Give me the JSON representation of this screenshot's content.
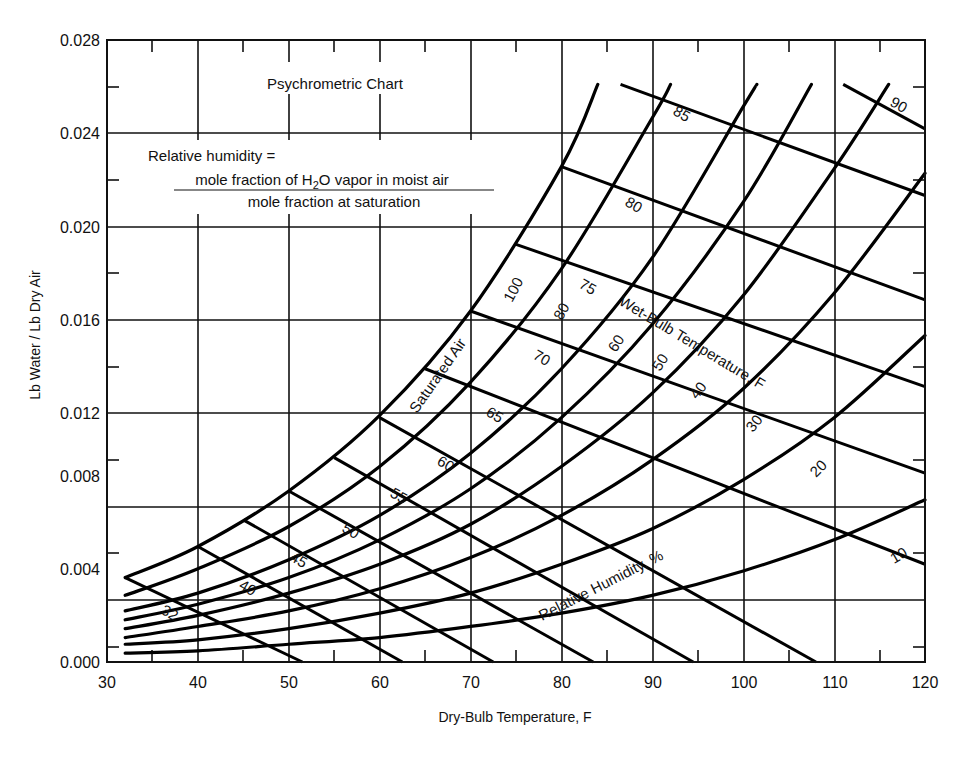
{
  "chart_data": {
    "type": "line",
    "title": "Psychrometric Chart",
    "xlabel": "Dry-Bulb Temperature, F",
    "ylabel": "Lb Water / Lb Dry Air",
    "xlim": [
      30,
      120
    ],
    "ylim": [
      0.0,
      0.028
    ],
    "x_ticks": [
      30,
      40,
      50,
      60,
      70,
      80,
      90,
      100,
      110,
      120
    ],
    "x_tick_labels": [
      "30",
      "40",
      "50",
      "60",
      "70",
      "80",
      "90",
      "100",
      "110",
      "120"
    ],
    "y_ticks": [
      0.0,
      0.004,
      0.008,
      0.012,
      0.016,
      0.02,
      0.024,
      0.028
    ],
    "y_tick_labels": [
      "0.000",
      "0.004",
      "0.008",
      "0.012",
      "0.016",
      "0.020",
      "0.024",
      "0.028"
    ],
    "grid": true,
    "annotation_definition": {
      "line1": "Relative humidity =",
      "numerator": "mole fraction of H2O vapor in moist air",
      "denominator": "mole fraction at saturation"
    },
    "labels": {
      "saturated": "Saturated Air",
      "wet_bulb_family": "Wet-Bulb Temperature, F",
      "rh_family": "Relative Humidity, %"
    },
    "relative_humidity_series": [
      {
        "name": "100",
        "points": [
          [
            32,
            0.0038
          ],
          [
            40,
            0.0052
          ],
          [
            50,
            0.0077
          ],
          [
            60,
            0.0111
          ],
          [
            70,
            0.0158
          ],
          [
            80,
            0.0223
          ],
          [
            84,
            0.026
          ]
        ]
      },
      {
        "name": "80",
        "points": [
          [
            32,
            0.003
          ],
          [
            40,
            0.0042
          ],
          [
            50,
            0.0061
          ],
          [
            60,
            0.0088
          ],
          [
            70,
            0.0126
          ],
          [
            80,
            0.0177
          ],
          [
            90,
            0.0245
          ],
          [
            92,
            0.026
          ]
        ]
      },
      {
        "name": "60",
        "points": [
          [
            32,
            0.0023
          ],
          [
            40,
            0.0031
          ],
          [
            50,
            0.0046
          ],
          [
            60,
            0.0066
          ],
          [
            70,
            0.0094
          ],
          [
            80,
            0.0132
          ],
          [
            90,
            0.0182
          ],
          [
            100,
            0.025
          ],
          [
            101.5,
            0.026
          ]
        ]
      },
      {
        "name": "50",
        "points": [
          [
            32,
            0.0019
          ],
          [
            40,
            0.0026
          ],
          [
            50,
            0.0038
          ],
          [
            60,
            0.0055
          ],
          [
            70,
            0.0078
          ],
          [
            80,
            0.011
          ],
          [
            90,
            0.0152
          ],
          [
            100,
            0.0207
          ],
          [
            107.5,
            0.026
          ]
        ]
      },
      {
        "name": "40",
        "points": [
          [
            32,
            0.0015
          ],
          [
            40,
            0.0021
          ],
          [
            50,
            0.0031
          ],
          [
            60,
            0.0044
          ],
          [
            70,
            0.0062
          ],
          [
            80,
            0.0088
          ],
          [
            90,
            0.0121
          ],
          [
            100,
            0.0165
          ],
          [
            110,
            0.0222
          ],
          [
            116,
            0.026
          ]
        ]
      },
      {
        "name": "30",
        "points": [
          [
            32,
            0.0011
          ],
          [
            40,
            0.0016
          ],
          [
            50,
            0.0023
          ],
          [
            60,
            0.0033
          ],
          [
            70,
            0.0047
          ],
          [
            80,
            0.0066
          ],
          [
            90,
            0.0091
          ],
          [
            100,
            0.0123
          ],
          [
            110,
            0.0166
          ],
          [
            120,
            0.022
          ]
        ]
      },
      {
        "name": "20",
        "points": [
          [
            32,
            0.0008
          ],
          [
            40,
            0.001
          ],
          [
            50,
            0.0015
          ],
          [
            60,
            0.0022
          ],
          [
            70,
            0.0031
          ],
          [
            80,
            0.0044
          ],
          [
            90,
            0.006
          ],
          [
            100,
            0.0082
          ],
          [
            110,
            0.011
          ],
          [
            120,
            0.0147
          ]
        ]
      },
      {
        "name": "10",
        "points": [
          [
            32,
            0.0004
          ],
          [
            40,
            0.0005
          ],
          [
            50,
            0.0008
          ],
          [
            60,
            0.0011
          ],
          [
            70,
            0.0016
          ],
          [
            80,
            0.0022
          ],
          [
            90,
            0.003
          ],
          [
            100,
            0.0041
          ],
          [
            110,
            0.0055
          ],
          [
            120,
            0.0073
          ]
        ]
      }
    ],
    "wet_bulb_series": [
      {
        "name": "32",
        "points": [
          [
            32,
            0.0038
          ],
          [
            51.5,
            0.0
          ]
        ]
      },
      {
        "name": "40",
        "points": [
          [
            40,
            0.0052
          ],
          [
            62.5,
            0.0
          ]
        ]
      },
      {
        "name": "45",
        "points": [
          [
            45,
            0.0064
          ],
          [
            72.5,
            0.0
          ]
        ]
      },
      {
        "name": "50",
        "points": [
          [
            50,
            0.0077
          ],
          [
            83.5,
            0.0
          ]
        ]
      },
      {
        "name": "55",
        "points": [
          [
            55,
            0.0092
          ],
          [
            94.5,
            0.0
          ]
        ]
      },
      {
        "name": "60",
        "points": [
          [
            60,
            0.011
          ],
          [
            108,
            0.0
          ]
        ]
      },
      {
        "name": "65",
        "points": [
          [
            65,
            0.0132
          ],
          [
            120,
            0.0044
          ]
        ]
      },
      {
        "name": "70",
        "points": [
          [
            70,
            0.0158
          ],
          [
            120,
            0.0085
          ]
        ]
      },
      {
        "name": "75",
        "points": [
          [
            75,
            0.0188
          ],
          [
            120,
            0.0124
          ]
        ]
      },
      {
        "name": "80",
        "points": [
          [
            80,
            0.0223
          ],
          [
            120,
            0.0163
          ]
        ]
      },
      {
        "name": "85",
        "points": [
          [
            86.5,
            0.026
          ],
          [
            120,
            0.021
          ]
        ]
      },
      {
        "name": "90",
        "points": [
          [
            111,
            0.026
          ],
          [
            120,
            0.024
          ]
        ]
      }
    ]
  },
  "text": {
    "title": "Psychrometric Chart",
    "def_line1": "Relative humidity =",
    "def_num": "mole fraction of H",
    "def_num_sub": "2",
    "def_num_rest": "O vapor in moist air",
    "def_den": "mole fraction at saturation",
    "xlabel": "Dry-Bulb Temperature, F",
    "ylabel": "Lb Water / Lb Dry Air",
    "saturated": "Saturated Air",
    "wet_bulb": "Wet-Bulb Temperature, F",
    "rh": "Relative Humidity, %",
    "xt": [
      "30",
      "40",
      "50",
      "60",
      "70",
      "80",
      "90",
      "100",
      "110",
      "120"
    ],
    "yt": [
      "0.000",
      "0.004",
      "0.008",
      "0.012",
      "0.016",
      "0.020",
      "0.024",
      "0.028"
    ],
    "rh_labels": [
      "100",
      "80",
      "60",
      "50",
      "40",
      "30",
      "20",
      "10"
    ],
    "wb_labels": [
      "32",
      "40",
      "45",
      "50",
      "55",
      "60",
      "65",
      "70",
      "75",
      "80",
      "85",
      "90"
    ]
  }
}
